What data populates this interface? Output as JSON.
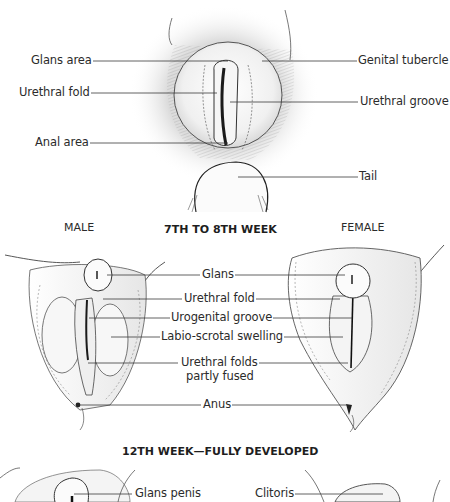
{
  "diagram": {
    "stage_1": {
      "labels_left": [
        {
          "text": "Glans area"
        },
        {
          "text": "Urethral fold"
        },
        {
          "text": "Anal area"
        }
      ],
      "labels_right": [
        {
          "text": "Genital tubercle"
        },
        {
          "text": "Urethral groove"
        },
        {
          "text": "Tail"
        }
      ]
    },
    "stage_2": {
      "heading": "7TH TO 8TH WEEK",
      "male_label": "MALE",
      "female_label": "FEMALE",
      "labels_center": [
        {
          "text": "Glans"
        },
        {
          "text": "Urethral fold"
        },
        {
          "text": "Urogenital groove"
        },
        {
          "text": "Labio-scrotal swelling"
        },
        {
          "text": "Urethral folds"
        },
        {
          "text": "partly fused"
        },
        {
          "text": "Anus"
        }
      ]
    },
    "stage_3": {
      "heading": "12TH WEEK—FULLY DEVELOPED",
      "labels": [
        {
          "text": "Glans penis"
        },
        {
          "text": "Clitoris"
        }
      ]
    },
    "colors": {
      "ink": "#2b2b2b",
      "leader_line": "#3a3a3a",
      "shading": "#bdbdbd",
      "background": "#ffffff"
    }
  }
}
